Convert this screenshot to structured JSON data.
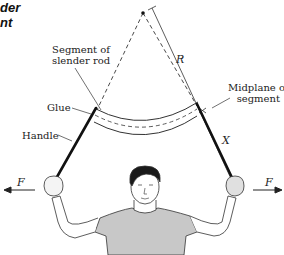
{
  "title": {
    "line1": "der",
    "line2": "nt"
  },
  "labels": {
    "segment": {
      "line1": "Segment of",
      "line2": "slender rod"
    },
    "glue": "Glue",
    "handle": "Handle",
    "midplane": {
      "line1": "Midplane of",
      "line2": "segment"
    },
    "radius": "R",
    "distance": "X",
    "force_left": "F",
    "force_right": "F"
  },
  "colors": {
    "line": "#222222",
    "handle": "#111111",
    "shirt": "#c8c8c8",
    "hair": "#1a1a1a"
  }
}
